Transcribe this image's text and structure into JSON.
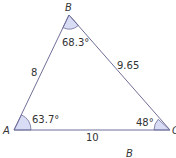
{
  "diagram": {
    "type": "triangle",
    "colors": {
      "edge": "#6f6f9a",
      "angle_fill": "#d8dcf4",
      "angle_stroke": "#6f6f9a",
      "text": "#333333"
    },
    "vertices": {
      "A": {
        "label": "A",
        "x": 14,
        "y": 130
      },
      "B": {
        "label": "B",
        "x": 69,
        "y": 15
      },
      "C": {
        "label": "C",
        "x": 170,
        "y": 130
      }
    },
    "sides": {
      "AB": "8",
      "BC": "9.65",
      "AC": "10"
    },
    "angles": {
      "A": "63.7°",
      "B": "68.3°",
      "C": "48°"
    },
    "extra_label": "B"
  }
}
